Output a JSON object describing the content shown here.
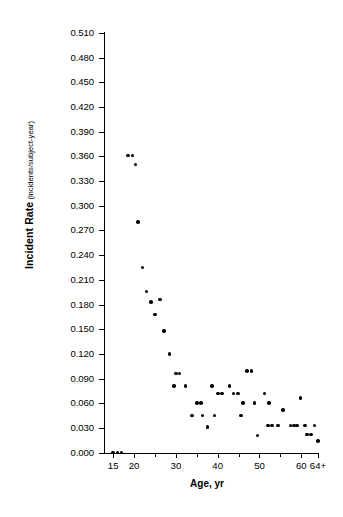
{
  "chart_data": {
    "type": "scatter",
    "title": "",
    "xlabel": "Age, yr",
    "ylabel": "Incident Rate",
    "ylabel_units": "(incidents/subject-year)",
    "xlim": [
      14,
      65
    ],
    "ylim": [
      0.0,
      0.51
    ],
    "grid": false,
    "legend": null,
    "ytick_labels": [
      "0.510",
      "0.480",
      "0.450",
      "0.420",
      "0.390",
      "0.360",
      "0.330",
      "0.300",
      "0.270",
      "0.240",
      "0.210",
      "0.180",
      "0.150",
      "0.120",
      "0.090",
      "0.060",
      "0.030",
      "0.000"
    ],
    "ytick_values": [
      0.51,
      0.48,
      0.45,
      0.42,
      0.39,
      0.36,
      0.33,
      0.3,
      0.27,
      0.24,
      0.21,
      0.18,
      0.15,
      0.12,
      0.09,
      0.06,
      0.03,
      0.0
    ],
    "xtick_labels": [
      "15",
      "20",
      "30",
      "40",
      "50",
      "60",
      "64+"
    ],
    "xtick_values": [
      15,
      20,
      30,
      40,
      50,
      60,
      64
    ],
    "xtick_minor": [
      25,
      35,
      45,
      55
    ],
    "marker": "filled-circle",
    "marker_color": "#000000",
    "points": [
      {
        "x": 15,
        "y": 0.0
      },
      {
        "x": 16,
        "y": 0.0
      },
      {
        "x": 17,
        "y": 0.0
      },
      {
        "x": 18.6,
        "y": 0.361
      },
      {
        "x": 19.6,
        "y": 0.361
      },
      {
        "x": 20.3,
        "y": 0.35
      },
      {
        "x": 21.0,
        "y": 0.28
      },
      {
        "x": 22.0,
        "y": 0.225
      },
      {
        "x": 23.0,
        "y": 0.196
      },
      {
        "x": 24.0,
        "y": 0.183
      },
      {
        "x": 26.2,
        "y": 0.186
      },
      {
        "x": 25.0,
        "y": 0.168
      },
      {
        "x": 27.2,
        "y": 0.148
      },
      {
        "x": 28.5,
        "y": 0.12
      },
      {
        "x": 30.0,
        "y": 0.096
      },
      {
        "x": 30.9,
        "y": 0.096
      },
      {
        "x": 29.6,
        "y": 0.081
      },
      {
        "x": 32.3,
        "y": 0.081
      },
      {
        "x": 35.0,
        "y": 0.06
      },
      {
        "x": 36.0,
        "y": 0.06
      },
      {
        "x": 33.8,
        "y": 0.045
      },
      {
        "x": 36.4,
        "y": 0.045
      },
      {
        "x": 37.6,
        "y": 0.031
      },
      {
        "x": 38.6,
        "y": 0.081
      },
      {
        "x": 40.1,
        "y": 0.072
      },
      {
        "x": 41.0,
        "y": 0.072
      },
      {
        "x": 39.2,
        "y": 0.045
      },
      {
        "x": 42.8,
        "y": 0.081
      },
      {
        "x": 43.8,
        "y": 0.072
      },
      {
        "x": 44.8,
        "y": 0.072
      },
      {
        "x": 46.1,
        "y": 0.06
      },
      {
        "x": 47.0,
        "y": 0.099
      },
      {
        "x": 48.1,
        "y": 0.099
      },
      {
        "x": 45.6,
        "y": 0.045
      },
      {
        "x": 48.8,
        "y": 0.06
      },
      {
        "x": 49.5,
        "y": 0.021
      },
      {
        "x": 51.2,
        "y": 0.072
      },
      {
        "x": 52.3,
        "y": 0.06
      },
      {
        "x": 52.0,
        "y": 0.033
      },
      {
        "x": 53.0,
        "y": 0.033
      },
      {
        "x": 54.5,
        "y": 0.033
      },
      {
        "x": 55.6,
        "y": 0.052
      },
      {
        "x": 57.4,
        "y": 0.033
      },
      {
        "x": 58.2,
        "y": 0.033
      },
      {
        "x": 59.0,
        "y": 0.033
      },
      {
        "x": 59.8,
        "y": 0.066
      },
      {
        "x": 60.9,
        "y": 0.033
      },
      {
        "x": 61.4,
        "y": 0.022
      },
      {
        "x": 62.3,
        "y": 0.022
      },
      {
        "x": 63.2,
        "y": 0.033
      },
      {
        "x": 64.0,
        "y": 0.014
      }
    ]
  },
  "axis": {
    "y_axis_title_main": "Incident Rate",
    "y_axis_title_sub": " (incidents/subject-year)",
    "x_axis_title": "Age, yr"
  }
}
